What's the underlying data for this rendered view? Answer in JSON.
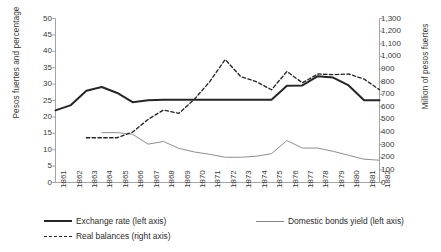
{
  "chart_data": {
    "type": "line",
    "title": "",
    "xlabel": "",
    "ylabel": "Pesos fuertes  and percentage",
    "ylabel_right": "Million of pesos fuertes",
    "grid": false,
    "legend_position": "bottom",
    "ylim": [
      0,
      50
    ],
    "ylim_right": [
      0,
      1300
    ],
    "yticks": [
      "0",
      "5",
      "10",
      "15",
      "20",
      "25",
      "30",
      "35",
      "40",
      "45",
      "50"
    ],
    "yticks_right": [
      "0",
      "100",
      "200",
      "300",
      "400",
      "500",
      "600",
      "700",
      "800",
      "900",
      "1,000",
      "1,100",
      "1,200",
      "1,300"
    ],
    "categories": [
      "1861",
      "1862",
      "1863",
      "1864",
      "1865",
      "1866",
      "1867",
      "1868",
      "1869",
      "1870",
      "1871",
      "1872",
      "1873",
      "1874",
      "1875",
      "1876",
      "1877",
      "1878",
      "1879",
      "1880",
      "1881",
      "1882"
    ],
    "series": [
      {
        "name": "Exchange rate (left axis)",
        "axis": "left",
        "style": "solid-thick",
        "color": "#262626",
        "values": [
          22.0,
          23.6,
          28.0,
          29.1,
          27.3,
          24.5,
          25.1,
          25.2,
          25.2,
          25.2,
          25.2,
          25.2,
          25.2,
          25.2,
          25.2,
          29.5,
          29.6,
          32.4,
          32.0,
          29.6,
          25.1,
          25.1
        ]
      },
      {
        "name": "Domestic bonds yield (left axis)",
        "axis": "left",
        "style": "solid-thin",
        "color": "#878787",
        "values": [
          null,
          null,
          null,
          15.2,
          15.2,
          14.7,
          11.7,
          12.5,
          10.4,
          9.3,
          8.6,
          7.7,
          7.7,
          8.0,
          8.8,
          12.8,
          10.5,
          10.5,
          9.5,
          8.3,
          7.1,
          6.8
        ]
      },
      {
        "name": "Real balances (right axis)",
        "axis": "right",
        "style": "dashed",
        "color": "#262626",
        "values": [
          null,
          null,
          355,
          355,
          355,
          400,
          500,
          575,
          548,
          660,
          800,
          975,
          840,
          800,
          735,
          880,
          790,
          860,
          855,
          860,
          820,
          735
        ]
      }
    ]
  },
  "legend": {
    "items": [
      {
        "label": "Exchange rate (left axis)",
        "style": "solid-thick"
      },
      {
        "label": "Domestic bonds yield (left axis)",
        "style": "solid-thin"
      },
      {
        "label": "Real balances (right axis)",
        "style": "dashed"
      }
    ]
  }
}
